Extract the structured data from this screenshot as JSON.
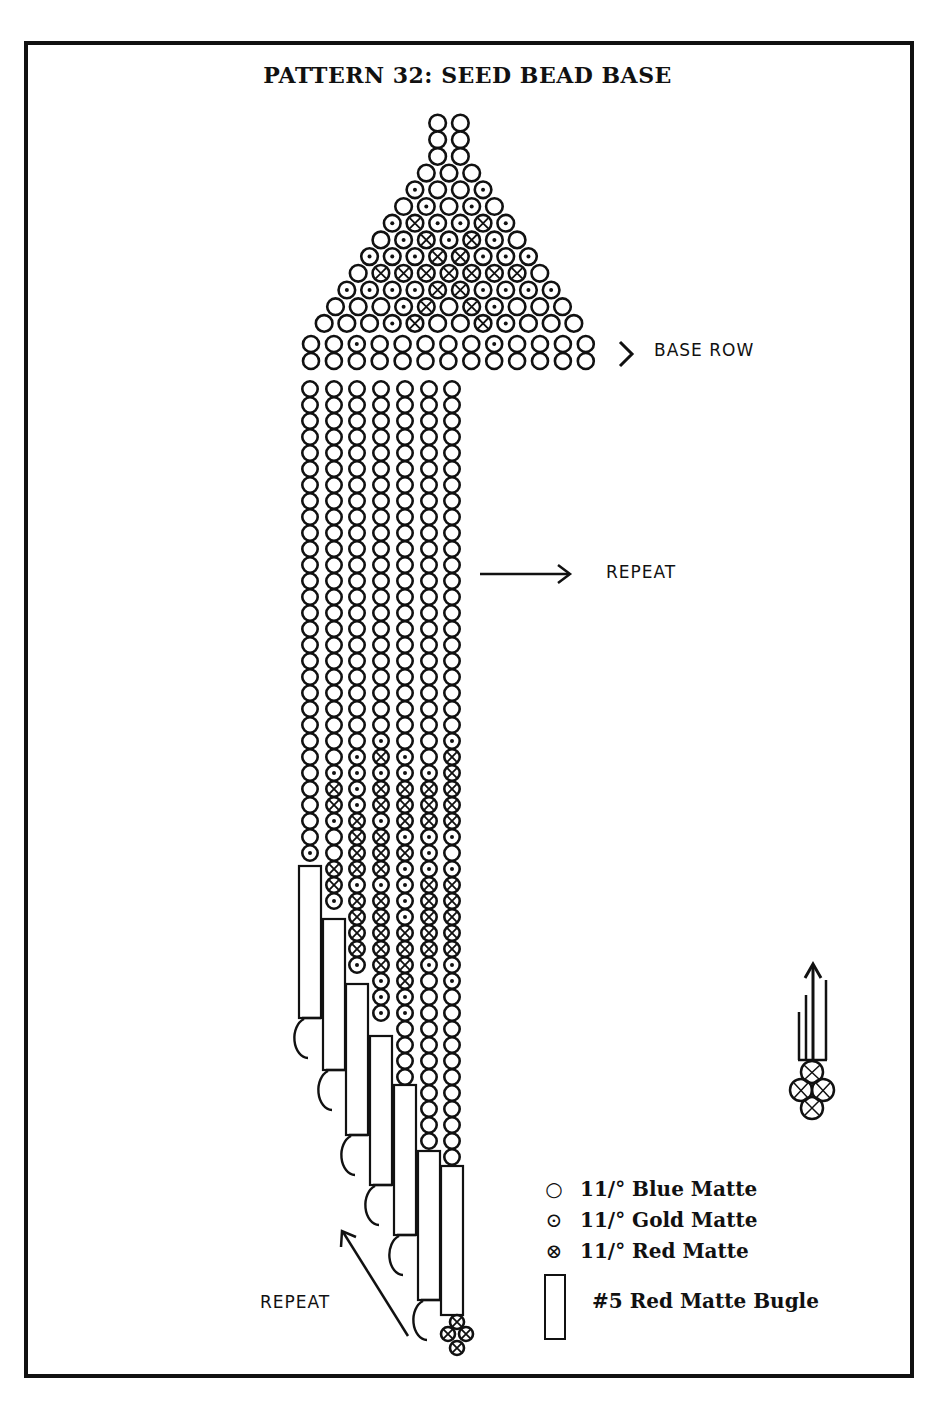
{
  "title": "PATTERN 32:  SEED BEAD BASE",
  "annotations": {
    "base_row": "BASE ROW",
    "repeat_right": "REPEAT",
    "repeat_bottom": "REPEAT"
  },
  "legend": [
    {
      "symbol": "○",
      "label": "11/° Blue Matte",
      "type": "blue-bead"
    },
    {
      "symbol": "⊙",
      "label": "11/° Gold Matte",
      "type": "gold-bead"
    },
    {
      "symbol": "⊗",
      "label": "11/° Red Matte",
      "type": "red-bead"
    },
    {
      "symbol": "▯",
      "label": "#5 Red Matte Bugle",
      "type": "bugle-bead"
    }
  ],
  "triangle_rows": [
    "OO",
    "OO",
    "OO",
    "OOO",
    "GOOG",
    "OGOGO",
    "GXGGXG",
    "OGXGXGO",
    "GGGXXGGG",
    "OXXXXXXXO",
    "GGGGXXGGGG",
    "OOOGXOXGOOO",
    "OOOGXOOXGOOO"
  ],
  "base_row": "OOGOOOOOGOOOO",
  "fringe_columns": [
    "OOOOOOOOOOOOOOOOOOOOOOOOOOOOOGXGOOGXGOOOOOO",
    "OOOOOOOOOOOOOOOOOOOOOOOOGXXGOOXXGXGOOOOOOOOOOOOOOOO",
    "OOOOOOOOOOOOOOOOOOOOOOOGGGGXXXXGXXXXGGGGOOOOOOOOOOOOOOOOOOO",
    "OOOOOOOOOOOOOOOOOOOOOOGXGXXGXXXGXXXXXGGGOOOOOOOOOOOOOOOOOOOOO",
    "OOOOOOOOOOOOOOOOOOOOOOOGGXXXGXGGGGXXXXGGOOOOOOOOOOOOOOOOOOOOOOOOOO",
    "OOOOOOOOOOOOOOOOOOOOOOOOGXXXGGGXXXXXGOOOOOOOOOOOOOOOOOOOOOOOOOOOOOOOOOO",
    "OOOOOOOOOOOOOOOOOOOOOOGXXXXXGOGXXXXXGGOOOOOOOOOOOOOOOOOOOOOOOOOOOOOOOOOOOO"
  ],
  "bugles": [
    {
      "col": 0,
      "top": 866,
      "bottom": 1018
    },
    {
      "col": 1,
      "top": 919,
      "bottom": 1070
    },
    {
      "col": 2,
      "top": 984,
      "bottom": 1135
    },
    {
      "col": 3,
      "top": 1036,
      "bottom": 1185
    },
    {
      "col": 4,
      "top": 1085,
      "bottom": 1235
    },
    {
      "col": 5,
      "top": 1151,
      "bottom": 1300
    },
    {
      "col": 6,
      "top": 1166,
      "bottom": 1315
    }
  ]
}
